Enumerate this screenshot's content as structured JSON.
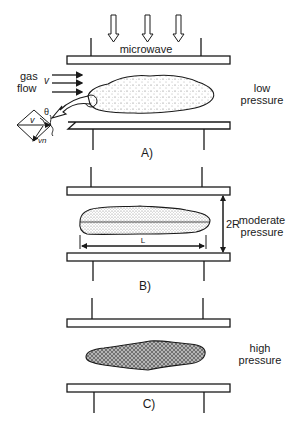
{
  "panels": {
    "a": {
      "label": "A)",
      "pressure_line1": "low",
      "pressure_line2": "pressure",
      "source_label": "microwave",
      "gas_line1": "gas",
      "gas_line2": "flow",
      "velocity_symbol": "v",
      "angle_symbol": "θ",
      "vector_v": "v",
      "vector_vn": "vn"
    },
    "b": {
      "label": "B)",
      "pressure_line1": "moderate",
      "pressure_line2": "pressure",
      "gap_label": "2R",
      "length_label": "L"
    },
    "c": {
      "label": "C)",
      "pressure_line1": "high",
      "pressure_line2": "pressure"
    }
  },
  "colors": {
    "stroke": "#1a1a1a",
    "fill_dots": "#555555",
    "fill_hatch": "#777777"
  }
}
